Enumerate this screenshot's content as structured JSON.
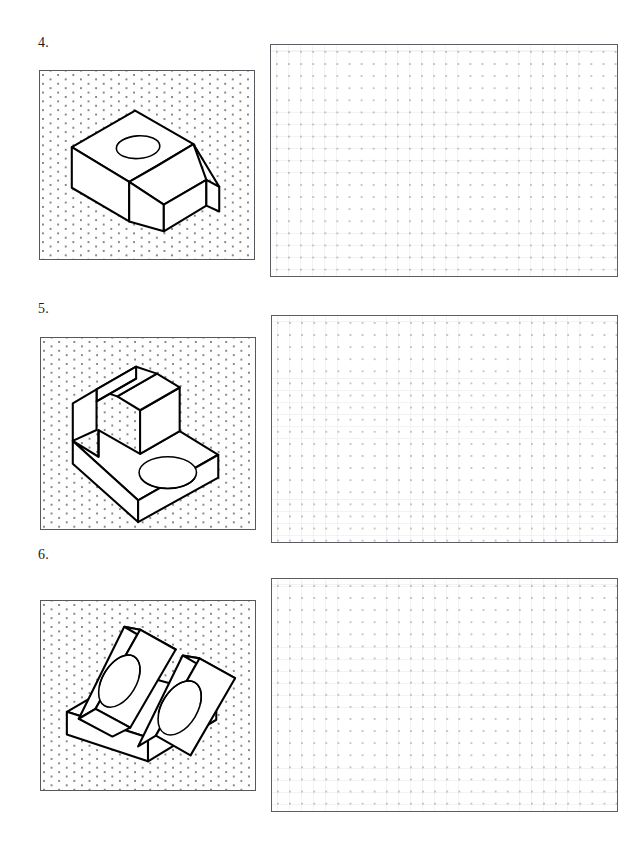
{
  "document": {
    "type": "orthographic-projection-worksheet",
    "page_width": 644,
    "page_height": 867,
    "background_color": "#ffffff",
    "ink_color": "#000000"
  },
  "problems": [
    {
      "number_label": "4.",
      "number_position": {
        "x": 38,
        "y": 36
      },
      "pictorial_panel": {
        "name": "isometric-pictorial-panel-4",
        "x": 39,
        "y": 70,
        "width": 216,
        "height": 190,
        "grid_type": "isometric-dot",
        "border_color": "#55585c",
        "object_description": "Rectangular block with inclined ramp face on the front-right and a circular through hole in the upper horizontal top face"
      },
      "answer_panel": {
        "name": "answer-grid-panel-4",
        "x": 270,
        "y": 44,
        "width": 348,
        "height": 233,
        "grid_type": "square-dot",
        "border_color": "#5a5d61",
        "content": ""
      }
    },
    {
      "number_label": "5.",
      "number_position": {
        "x": 38,
        "y": 302
      },
      "pictorial_panel": {
        "name": "isometric-pictorial-panel-5",
        "x": 40,
        "y": 337,
        "width": 216,
        "height": 193,
        "grid_type": "isometric-dot",
        "border_color": "#55585c",
        "object_description": "L-shaped base plate with a circular through hole in the horizontal flange and an upright wall having a chamfered angled top edge"
      },
      "answer_panel": {
        "name": "answer-grid-panel-5",
        "x": 271,
        "y": 315,
        "width": 347,
        "height": 228,
        "grid_type": "square-dot",
        "border_color": "#5a5d61",
        "content": ""
      }
    },
    {
      "number_label": "6.",
      "number_position": {
        "x": 38,
        "y": 548
      },
      "pictorial_panel": {
        "name": "isometric-pictorial-panel-6",
        "x": 40,
        "y": 600,
        "width": 216,
        "height": 191,
        "grid_type": "isometric-dot",
        "border_color": "#55585c",
        "object_description": "Rectangular base plate supporting two parallel inclined triangular ribs, each rib pierced by a circular through hole"
      },
      "answer_panel": {
        "name": "answer-grid-panel-6",
        "x": 271,
        "y": 578,
        "width": 347,
        "height": 234,
        "grid_type": "square-dot",
        "border_color": "#5a5d61",
        "content": ""
      }
    }
  ]
}
